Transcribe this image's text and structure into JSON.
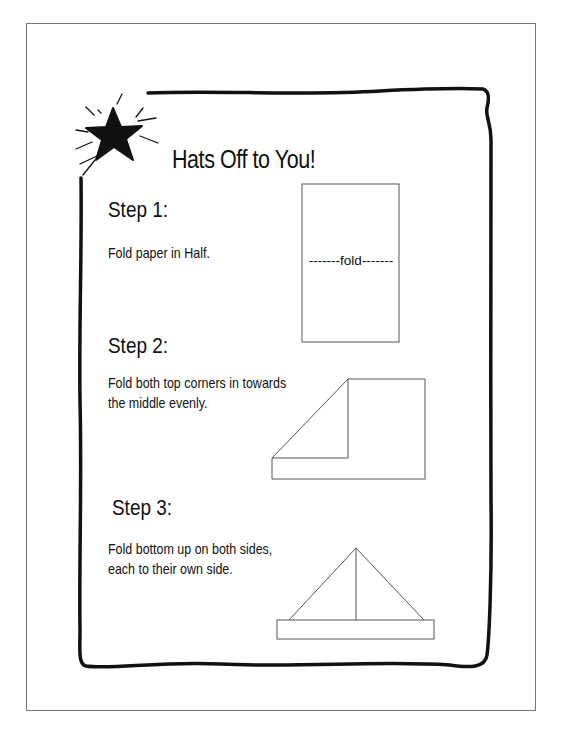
{
  "title": "Hats Off to You!",
  "steps": [
    {
      "heading": "Step 1:",
      "lines": [
        "Fold paper in Half."
      ]
    },
    {
      "heading": "Step 2:",
      "lines": [
        "Fold both top corners in towards",
        "the middle evenly."
      ]
    },
    {
      "heading": "Step 3:",
      "lines": [
        "Fold bottom up on both sides,",
        "each to their own side."
      ]
    }
  ],
  "diagram1": {
    "fold_label": "-------fold-------"
  },
  "icons": {
    "decoration": "star-burst-icon"
  },
  "colors": {
    "ink": "#111111",
    "border": "#777777",
    "diagram_line": "#555555"
  }
}
